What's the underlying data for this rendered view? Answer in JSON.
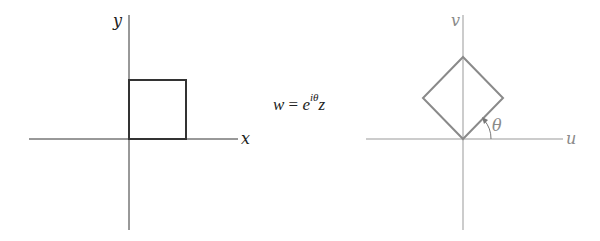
{
  "left_plane": {
    "x_label": "x",
    "y_label": "y",
    "shape": "square",
    "color": "#333333"
  },
  "mapping": {
    "lhs": "w",
    "equals": "=",
    "base": "e",
    "exponent": "iθ",
    "var": "z"
  },
  "right_plane": {
    "u_label": "u",
    "v_label": "v",
    "angle_label": "θ",
    "shape": "rotated-square",
    "color": "#8a8a8a"
  }
}
